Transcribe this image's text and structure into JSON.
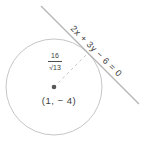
{
  "figure": {
    "background": "#ffffff",
    "line_label": "2x + 3y − 6 = 0",
    "center_label": "(1, − 4)",
    "radius_label": {
      "numerator": "16",
      "denominator": "√13"
    }
  },
  "colors": {
    "circle_stroke": "#c6c6c6",
    "tangent_line": "#b5b5b5",
    "radius_dash": "#c9c9c9",
    "center_dot": "#585858",
    "text": "#3d3d3d"
  }
}
